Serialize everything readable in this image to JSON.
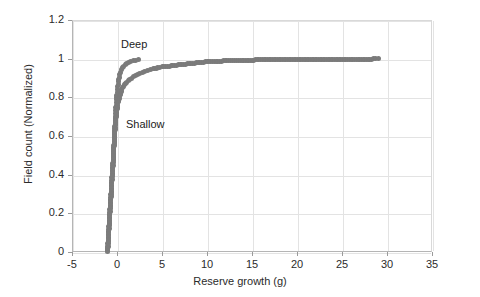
{
  "chart_data": {
    "type": "scatter",
    "title": "",
    "xlabel": "Reserve growth (g)",
    "ylabel": "Field count (Normalized)",
    "xlim": [
      -5,
      35
    ],
    "ylim": [
      0,
      1.2
    ],
    "xticks": [
      -5,
      0,
      5,
      10,
      15,
      20,
      25,
      30,
      35
    ],
    "yticks": [
      0,
      0.2,
      0.4,
      0.6,
      0.8,
      1,
      1.2
    ],
    "xtick_labels": [
      "-5",
      "0",
      "5",
      "10",
      "15",
      "20",
      "25",
      "30",
      "35"
    ],
    "ytick_labels": [
      "0",
      "0.2",
      "0.4",
      "0.6",
      "0.8",
      "1",
      "1.2"
    ],
    "grid": true,
    "legend_position": "none",
    "marker_color": "#7b7b7b",
    "annotations": [
      {
        "text": "Deep",
        "x": 0.45,
        "y": 1.07
      },
      {
        "text": "Shallow",
        "x": 1.0,
        "y": 0.655
      }
    ],
    "series": [
      {
        "name": "Deep",
        "x": [
          -1.05,
          -1.02,
          -1.0,
          -0.98,
          -0.96,
          -0.94,
          -0.92,
          -0.9,
          -0.88,
          -0.86,
          -0.84,
          -0.82,
          -0.8,
          -0.78,
          -0.76,
          -0.74,
          -0.72,
          -0.7,
          -0.68,
          -0.66,
          -0.64,
          -0.62,
          -0.6,
          -0.58,
          -0.56,
          -0.54,
          -0.52,
          -0.5,
          -0.48,
          -0.46,
          -0.44,
          -0.42,
          -0.4,
          -0.38,
          -0.36,
          -0.34,
          -0.32,
          -0.3,
          -0.28,
          -0.26,
          -0.24,
          -0.22,
          -0.2,
          -0.18,
          -0.16,
          -0.14,
          -0.12,
          -0.1,
          -0.08,
          -0.06,
          -0.04,
          -0.02,
          0.0,
          0.04,
          0.08,
          0.12,
          0.16,
          0.2,
          0.26,
          0.32,
          0.4,
          0.5,
          0.62,
          0.76,
          0.92,
          1.1,
          1.3,
          1.55,
          1.8,
          2.1,
          2.4
        ],
        "y": [
          0.01,
          0.02,
          0.03,
          0.045,
          0.06,
          0.075,
          0.09,
          0.105,
          0.12,
          0.135,
          0.15,
          0.165,
          0.18,
          0.195,
          0.21,
          0.225,
          0.24,
          0.255,
          0.27,
          0.285,
          0.3,
          0.315,
          0.33,
          0.345,
          0.36,
          0.375,
          0.39,
          0.405,
          0.42,
          0.435,
          0.45,
          0.465,
          0.48,
          0.5,
          0.52,
          0.54,
          0.56,
          0.58,
          0.6,
          0.62,
          0.64,
          0.66,
          0.68,
          0.7,
          0.715,
          0.73,
          0.745,
          0.76,
          0.775,
          0.79,
          0.8,
          0.812,
          0.824,
          0.84,
          0.855,
          0.868,
          0.88,
          0.89,
          0.905,
          0.918,
          0.93,
          0.942,
          0.952,
          0.961,
          0.968,
          0.974,
          0.979,
          0.984,
          0.988,
          0.992,
          0.996
        ]
      },
      {
        "name": "Shallow",
        "x": [
          -1.1,
          -1.08,
          -1.06,
          -1.04,
          -1.02,
          -1.0,
          -0.98,
          -0.96,
          -0.94,
          -0.92,
          -0.9,
          -0.88,
          -0.86,
          -0.84,
          -0.82,
          -0.8,
          -0.78,
          -0.76,
          -0.74,
          -0.72,
          -0.7,
          -0.68,
          -0.66,
          -0.64,
          -0.62,
          -0.6,
          -0.58,
          -0.56,
          -0.54,
          -0.52,
          -0.5,
          -0.48,
          -0.46,
          -0.44,
          -0.42,
          -0.4,
          -0.38,
          -0.36,
          -0.34,
          -0.32,
          -0.3,
          -0.28,
          -0.26,
          -0.24,
          -0.22,
          -0.2,
          -0.18,
          -0.16,
          -0.14,
          -0.12,
          -0.1,
          -0.08,
          -0.06,
          -0.04,
          -0.02,
          0.0,
          0.03,
          0.06,
          0.1,
          0.14,
          0.18,
          0.23,
          0.28,
          0.34,
          0.4,
          0.47,
          0.55,
          0.64,
          0.74,
          0.85,
          0.97,
          1.1,
          1.25,
          1.4,
          1.6,
          1.8,
          2.0,
          2.25,
          2.5,
          2.8,
          3.1,
          3.4,
          3.7,
          4.0,
          4.35,
          4.7,
          5.0,
          5.4,
          5.8,
          6.2,
          6.6,
          7.0,
          7.4,
          7.8,
          8.2,
          8.6,
          9.0,
          9.4,
          9.8,
          11.0,
          11.8,
          12.6,
          13.3,
          13.9,
          15.0,
          17.1,
          20.6,
          25.6,
          26.4,
          28.3,
          29.0
        ],
        "y": [
          0.005,
          0.012,
          0.02,
          0.03,
          0.042,
          0.055,
          0.07,
          0.085,
          0.1,
          0.115,
          0.13,
          0.145,
          0.16,
          0.175,
          0.19,
          0.205,
          0.22,
          0.235,
          0.25,
          0.265,
          0.28,
          0.295,
          0.31,
          0.325,
          0.34,
          0.355,
          0.37,
          0.385,
          0.4,
          0.415,
          0.43,
          0.445,
          0.46,
          0.475,
          0.49,
          0.505,
          0.52,
          0.535,
          0.55,
          0.565,
          0.58,
          0.595,
          0.61,
          0.622,
          0.634,
          0.646,
          0.658,
          0.67,
          0.68,
          0.69,
          0.7,
          0.708,
          0.716,
          0.724,
          0.732,
          0.74,
          0.75,
          0.758,
          0.768,
          0.777,
          0.786,
          0.795,
          0.804,
          0.813,
          0.822,
          0.831,
          0.84,
          0.849,
          0.857,
          0.865,
          0.872,
          0.879,
          0.886,
          0.892,
          0.9,
          0.907,
          0.913,
          0.919,
          0.925,
          0.931,
          0.936,
          0.94,
          0.944,
          0.948,
          0.951,
          0.954,
          0.957,
          0.96,
          0.962,
          0.965,
          0.967,
          0.969,
          0.971,
          0.973,
          0.975,
          0.977,
          0.979,
          0.981,
          0.983,
          0.986,
          0.988,
          0.989,
          0.99,
          0.991,
          0.993,
          0.994,
          0.995,
          0.997,
          0.997,
          0.998,
          0.999
        ]
      }
    ]
  }
}
